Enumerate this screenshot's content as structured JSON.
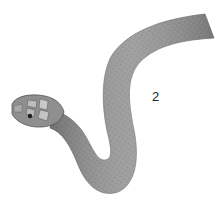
{
  "image": {
    "subject": "snake illustration",
    "figure_label": "2",
    "colors": {
      "background": "#ffffff",
      "body": "#8a8a8a",
      "body_dark": "#5a5a5a",
      "body_light": "#b5b5b5",
      "label": "#222222"
    }
  }
}
